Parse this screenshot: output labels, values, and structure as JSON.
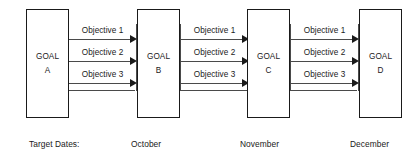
{
  "diagram": {
    "colors": {
      "stroke": "#1a1a1a",
      "line": "#4a4a4a",
      "background": "#ffffff"
    },
    "goals": [
      {
        "id": "a",
        "word": "GOAL",
        "letter": "A"
      },
      {
        "id": "b",
        "word": "GOAL",
        "letter": "B"
      },
      {
        "id": "c",
        "word": "GOAL",
        "letter": "C"
      },
      {
        "id": "d",
        "word": "GOAL",
        "letter": "D"
      }
    ],
    "connectors": [
      {
        "id": "a-to-b",
        "objectives": [
          "Objective 1",
          "Objective 2",
          "Objective 3"
        ]
      },
      {
        "id": "b-to-c",
        "objectives": [
          "Objective 1",
          "Objective 2",
          "Objective 3"
        ]
      },
      {
        "id": "c-to-d",
        "objectives": [
          "Objective 1",
          "Objective 2",
          "Objective 3"
        ]
      }
    ],
    "target_dates": {
      "label": "Target Dates:",
      "values": [
        "October",
        "November",
        "December"
      ]
    }
  }
}
